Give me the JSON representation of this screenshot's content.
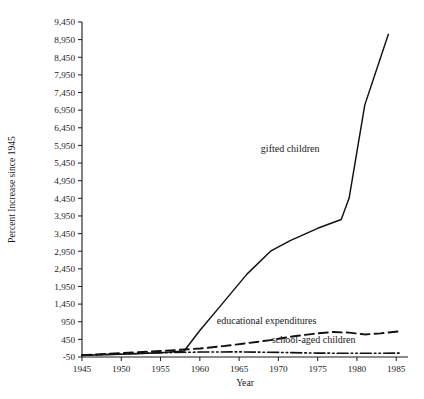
{
  "chart_data": {
    "type": "line",
    "title": "",
    "xlabel": "Year",
    "ylabel": "Percent Increase since 1945",
    "xlim": [
      1945,
      1986.5
    ],
    "ylim": [
      -50,
      9450
    ],
    "grid": false,
    "legend": "inline-labels",
    "x_ticks": [
      1945,
      1950,
      1955,
      1960,
      1965,
      1970,
      1975,
      1980,
      1985
    ],
    "x_tick_labels": [
      "1945",
      "1950",
      "1955",
      "1960",
      "1965",
      "1970",
      "1975",
      "1980",
      "1985"
    ],
    "y_ticks": [
      -50,
      450,
      950,
      1450,
      1950,
      2450,
      2950,
      3450,
      3950,
      4450,
      4950,
      5450,
      5950,
      6450,
      6950,
      7450,
      7950,
      8450,
      8950,
      9450
    ],
    "y_tick_labels": [
      "-50",
      "450",
      "950",
      "1,450",
      "1,950",
      "2,450",
      "2,950",
      "3,450",
      "3,950",
      "4,450",
      "4,950",
      "5,450",
      "5,950",
      "6,450",
      "6,950",
      "7,450",
      "7,950",
      "8,450",
      "8,950",
      "9,450"
    ],
    "series": [
      {
        "name": "gifted children",
        "style": "solid",
        "label_x": 1971.5,
        "label_y": 5750,
        "x": [
          1945,
          1950,
          1955,
          1958,
          1960,
          1963,
          1966,
          1969,
          1971.5,
          1975,
          1978,
          1979,
          1981,
          1984
        ],
        "values": [
          0,
          30,
          70,
          120,
          700,
          1500,
          2300,
          2950,
          3250,
          3600,
          3850,
          4450,
          7100,
          9100
        ]
      },
      {
        "name": "educational expenditures",
        "style": "dashed",
        "label_x": 1968.5,
        "label_y": 900,
        "x": [
          1945,
          1950,
          1955,
          1960,
          1963,
          1966,
          1969,
          1972,
          1975,
          1977,
          1979,
          1981,
          1983,
          1985.5
        ],
        "values": [
          0,
          60,
          120,
          190,
          260,
          340,
          430,
          540,
          620,
          660,
          640,
          590,
          620,
          680
        ]
      },
      {
        "name": "school-aged children",
        "style": "dash-dot",
        "label_x": 1974.5,
        "label_y": 340,
        "x": [
          1945,
          1950,
          1955,
          1960,
          1965,
          1970,
          1975,
          1980,
          1985.5
        ],
        "values": [
          0,
          35,
          70,
          90,
          95,
          80,
          60,
          55,
          60
        ]
      }
    ]
  }
}
